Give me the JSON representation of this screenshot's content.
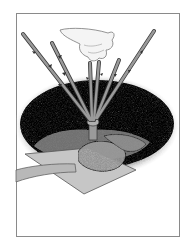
{
  "illustration": {
    "subject": "planting a bare-root rose bush",
    "elements": [
      "hand",
      "rose-canes",
      "planting-hole",
      "soil-mound",
      "shovel"
    ],
    "colors": {
      "frame": "#8a8a8a",
      "soil_dark": "#2a2a2a",
      "soil_rim": "#bdbdbd",
      "mound": "#a8a8a8",
      "cane": "#8f8f8f",
      "cane_edge": "#3a3a3a",
      "shovel": "#c4c4c4",
      "hand": "#f2f2f2"
    }
  }
}
